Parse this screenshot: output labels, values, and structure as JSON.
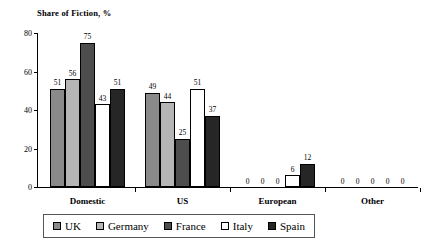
{
  "chart_data": {
    "type": "bar",
    "title": "Share of Fiction, %",
    "xlabel": "",
    "ylabel": "",
    "ylim": [
      0,
      80
    ],
    "yticks": [
      0,
      20,
      40,
      60,
      80
    ],
    "grid": false,
    "legend_position": "bottom",
    "categories": [
      "Domestic",
      "US",
      "European",
      "Other"
    ],
    "series": [
      {
        "name": "UK",
        "color": "#8a8a8a",
        "values": [
          51,
          49,
          0,
          0
        ]
      },
      {
        "name": "Germany",
        "color": "#b5b5b5",
        "values": [
          56,
          44,
          0,
          0
        ]
      },
      {
        "name": "France",
        "color": "#4d4d4d",
        "values": [
          75,
          25,
          0,
          0
        ]
      },
      {
        "name": "Italy",
        "color": "#ffffff",
        "values": [
          43,
          51,
          6,
          0
        ]
      },
      {
        "name": "Spain",
        "color": "#262626",
        "values": [
          51,
          37,
          12,
          0
        ]
      }
    ]
  },
  "axis": {
    "y_tick_labels": [
      "0",
      "20",
      "40",
      "60",
      "80"
    ]
  },
  "legend": {
    "items": [
      {
        "label": "UK"
      },
      {
        "label": "Germany"
      },
      {
        "label": "France"
      },
      {
        "label": "Italy"
      },
      {
        "label": "Spain"
      }
    ]
  }
}
